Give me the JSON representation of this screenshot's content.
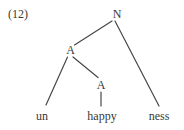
{
  "figure": {
    "example_number": "(12)",
    "colors": {
      "ink": "#383838",
      "edge": "#474747",
      "background": "#ffffff"
    },
    "tree": {
      "type": "morphological-syntax-tree",
      "word": "unhappyness",
      "root_label": "N",
      "upper_a_label": "A",
      "lower_a_label": "A",
      "leaf_un": "un",
      "leaf_happy": "happy",
      "leaf_ness": "ness"
    }
  }
}
